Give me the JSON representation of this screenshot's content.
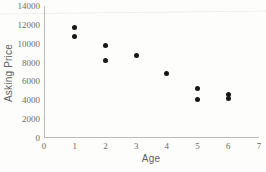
{
  "chart_data": {
    "type": "scatter",
    "title": "",
    "xlabel": "Age",
    "ylabel": "Asking Price",
    "xlim": [
      0,
      7
    ],
    "ylim": [
      0,
      14000
    ],
    "x_ticks": [
      0,
      1,
      2,
      3,
      4,
      5,
      6,
      7
    ],
    "y_ticks": [
      0,
      2000,
      4000,
      6000,
      8000,
      10000,
      12000,
      14000
    ],
    "grid": false,
    "legend": false,
    "marker": "filled-circle",
    "points": [
      {
        "x": 1,
        "y": 11700
      },
      {
        "x": 1,
        "y": 10800
      },
      {
        "x": 2,
        "y": 9800
      },
      {
        "x": 2,
        "y": 8200
      },
      {
        "x": 3,
        "y": 8800
      },
      {
        "x": 4,
        "y": 6800
      },
      {
        "x": 5,
        "y": 5200
      },
      {
        "x": 5,
        "y": 4100
      },
      {
        "x": 6,
        "y": 4600
      },
      {
        "x": 6,
        "y": 4200
      }
    ]
  },
  "colors": {
    "background": "#fdfdfc",
    "point": "#161616",
    "axis_line": "#bdbbb8",
    "tick_label": "#6e6c69",
    "axis_title": "#5f5f5f"
  }
}
